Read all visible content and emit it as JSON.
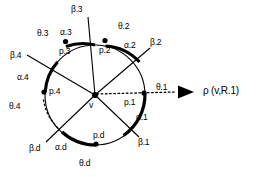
{
  "figure": {
    "type": "geometric-diagram",
    "title_text": "",
    "center_vertex": {
      "label": "v",
      "x": 95,
      "y": 95
    },
    "circle": {
      "cx": 95,
      "cy": 95,
      "r": 50
    },
    "reference_ray": {
      "label": "rho-label",
      "text": "ρ (v,R.1)",
      "angle_label": "θ.1",
      "style": "dotted-with-arrowhead"
    },
    "boundary_points": [
      {
        "name": "p.1",
        "label": "p.1",
        "x": 144,
        "y": 93
      },
      {
        "name": "p.2",
        "label": "p.2",
        "x": 105,
        "y": 40
      },
      {
        "name": "p.3",
        "label": "p.3",
        "x": 66,
        "y": 41
      },
      {
        "name": "p.4",
        "label": "p.4",
        "x": 44,
        "y": 92
      },
      {
        "name": "p.d",
        "label": "p.d",
        "x": 96,
        "y": 143
      }
    ],
    "beta_rays": [
      {
        "name": "beta-1",
        "label": "β.1"
      },
      {
        "name": "beta-2",
        "label": "β.2"
      },
      {
        "name": "beta-3",
        "label": "β.3"
      },
      {
        "name": "beta-4",
        "label": "β.4"
      },
      {
        "name": "beta-d",
        "label": "β.d"
      }
    ],
    "alpha_arcs": [
      {
        "name": "alpha-1",
        "label": "α.1"
      },
      {
        "name": "alpha-2",
        "label": "α.2"
      },
      {
        "name": "alpha-3",
        "label": "α.3"
      },
      {
        "name": "alpha-4",
        "label": "α.4"
      },
      {
        "name": "alpha-d",
        "label": "α.d"
      }
    ],
    "theta_labels": [
      {
        "name": "theta-1",
        "label": "θ.1"
      },
      {
        "name": "theta-2",
        "label": "θ.2"
      },
      {
        "name": "theta-3",
        "label": "θ.3"
      },
      {
        "name": "theta-4",
        "label": "θ.4"
      },
      {
        "name": "theta-d",
        "label": "θ.d"
      }
    ],
    "colors": {
      "stroke": "#000000",
      "background": "#ffffff"
    }
  }
}
